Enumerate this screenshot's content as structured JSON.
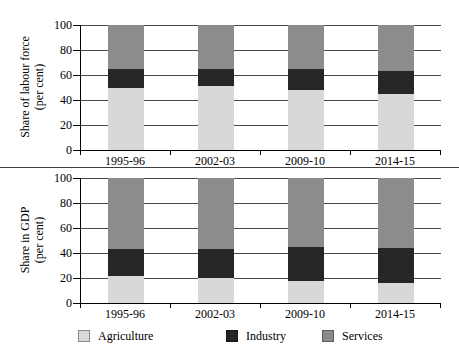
{
  "colors": {
    "agriculture": "#d8d8d8",
    "industry": "#262626",
    "services": "#8c8c8c",
    "axis": "#000000",
    "grid": "#4a4a4a"
  },
  "legend": {
    "items": [
      {
        "label": "Agriculture",
        "color": "#d8d8d8"
      },
      {
        "label": "Industry",
        "color": "#262626"
      },
      {
        "label": "Services",
        "color": "#8c8c8c"
      }
    ]
  },
  "chart_data": [
    {
      "type": "bar",
      "stacked": true,
      "ylabel_line1": "Share of labour force",
      "ylabel_line2": "(per cent)",
      "categories": [
        "1995-96",
        "2002-03",
        "2009-10",
        "2014-15"
      ],
      "yticks": [
        0,
        20,
        40,
        60,
        80,
        100
      ],
      "ylim": [
        0,
        100
      ],
      "grid": "horizontal",
      "legend_position": "bottom-shared",
      "series": [
        {
          "name": "Agriculture",
          "values": [
            50,
            51,
            48,
            45
          ]
        },
        {
          "name": "Industry",
          "values": [
            15,
            14,
            17,
            18
          ]
        },
        {
          "name": "Services",
          "values": [
            35,
            35,
            35,
            37
          ]
        }
      ]
    },
    {
      "type": "bar",
      "stacked": true,
      "ylabel_line1": "Share in GDP",
      "ylabel_line2": "(per cent)",
      "categories": [
        "1995-96",
        "2002-03",
        "2009-10",
        "2014-15"
      ],
      "yticks": [
        0,
        20,
        40,
        60,
        80,
        100
      ],
      "ylim": [
        0,
        100
      ],
      "grid": "horizontal",
      "legend_position": "bottom-shared",
      "series": [
        {
          "name": "Agriculture",
          "values": [
            22,
            20,
            18,
            16
          ]
        },
        {
          "name": "Industry",
          "values": [
            21,
            23,
            27,
            28
          ]
        },
        {
          "name": "Services",
          "values": [
            57,
            57,
            55,
            56
          ]
        }
      ]
    }
  ]
}
